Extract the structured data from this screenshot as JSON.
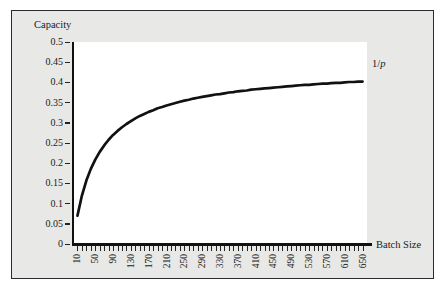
{
  "figure": {
    "background_color": "#e8e8e6",
    "border_color": "#2b2b2b",
    "plot_background_color": "#ffffff"
  },
  "labels": {
    "y_axis_title": "Capacity",
    "x_axis_title": "Batch Size",
    "asymptote_prefix": "1/",
    "asymptote_symbol": "p"
  },
  "chart_data": {
    "type": "line",
    "title": "",
    "subtitle": "",
    "xlabel": "Batch Size",
    "ylabel": "Capacity",
    "xlim": [
      0,
      660
    ],
    "ylim": [
      0,
      0.5
    ],
    "grid": false,
    "legend": "none",
    "annotations": [
      {
        "text": "1/p",
        "x": 660,
        "y": 0.458,
        "note": "asymptotic capacity limit"
      }
    ],
    "ytick_labels": [
      "0",
      "0.05",
      "0.1",
      "0.15",
      "0.2",
      "0.25",
      "0.3",
      "0.35",
      "0.4",
      "0.45",
      "0.5"
    ],
    "ytick_values": [
      0,
      0.05,
      0.1,
      0.15,
      0.2,
      0.25,
      0.3,
      0.35,
      0.4,
      0.45,
      0.5
    ],
    "xtick_labels": [
      "10",
      "50",
      "90",
      "130",
      "170",
      "210",
      "250",
      "290",
      "330",
      "370",
      "410",
      "450",
      "490",
      "530",
      "570",
      "610",
      "650"
    ],
    "xtick_values": [
      10,
      50,
      90,
      130,
      170,
      210,
      250,
      290,
      330,
      370,
      410,
      450,
      490,
      530,
      570,
      610,
      650
    ],
    "minor_tick_step": 10,
    "series": [
      {
        "name": "Capacity",
        "color": "#111111",
        "line_width": 2.6,
        "x": [
          10,
          20,
          30,
          40,
          50,
          60,
          70,
          80,
          90,
          100,
          110,
          120,
          130,
          140,
          150,
          160,
          170,
          180,
          190,
          200,
          210,
          220,
          230,
          240,
          250,
          260,
          270,
          280,
          290,
          300,
          310,
          320,
          330,
          340,
          350,
          360,
          370,
          380,
          390,
          400,
          410,
          420,
          430,
          440,
          450,
          460,
          470,
          480,
          490,
          500,
          510,
          520,
          530,
          540,
          550,
          560,
          570,
          580,
          590,
          600,
          610,
          620,
          630,
          640,
          650
        ],
        "y": [
          0.07,
          0.12,
          0.157,
          0.186,
          0.209,
          0.228,
          0.244,
          0.258,
          0.27,
          0.28,
          0.289,
          0.297,
          0.304,
          0.311,
          0.317,
          0.322,
          0.327,
          0.331,
          0.336,
          0.339,
          0.343,
          0.346,
          0.349,
          0.352,
          0.355,
          0.357,
          0.36,
          0.362,
          0.364,
          0.366,
          0.368,
          0.37,
          0.371,
          0.373,
          0.375,
          0.376,
          0.378,
          0.379,
          0.38,
          0.382,
          0.383,
          0.384,
          0.385,
          0.386,
          0.387,
          0.388,
          0.389,
          0.39,
          0.391,
          0.392,
          0.393,
          0.394,
          0.394,
          0.395,
          0.396,
          0.397,
          0.397,
          0.398,
          0.399,
          0.399,
          0.4,
          0.401,
          0.401,
          0.402,
          0.402
        ],
        "asymptote": 0.458
      }
    ]
  }
}
